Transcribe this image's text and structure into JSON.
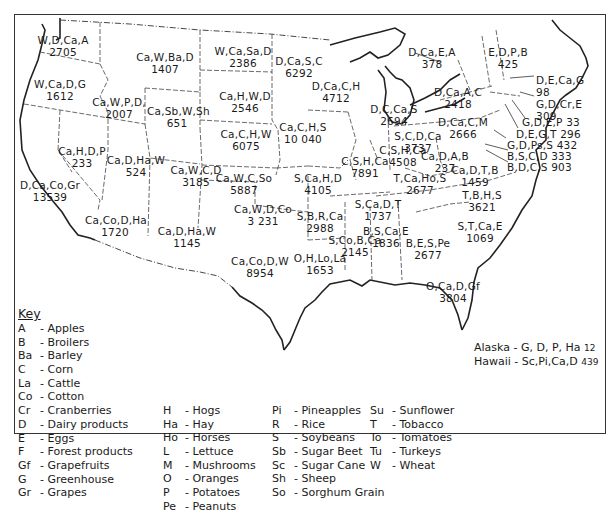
{
  "map": {
    "states": [
      {
        "id": "WA",
        "crops": "W,D,Ca,A",
        "value": "2705",
        "x": 63,
        "y": 34
      },
      {
        "id": "OR",
        "crops": "W,Ca,D,G",
        "value": "1612",
        "x": 60,
        "y": 78
      },
      {
        "id": "ID",
        "crops": "Ca,W,P,D,",
        "value": "2007",
        "x": 119,
        "y": 96
      },
      {
        "id": "MT",
        "crops": "Ca,W,Ba,D",
        "value": "1407",
        "x": 165,
        "y": 51
      },
      {
        "id": "WY",
        "crops": "Ca,Sb,W,Sh",
        "value": "651",
        "x": 177,
        "y": 105
      },
      {
        "id": "ND",
        "crops": "W,Ca,Sa,D",
        "value": "2386",
        "x": 243,
        "y": 45
      },
      {
        "id": "SD",
        "crops": "Ca,H,W,D",
        "value": "2546",
        "x": 245,
        "y": 90
      },
      {
        "id": "NE",
        "crops": "Ca,C,H,W",
        "value": "6075",
        "x": 246,
        "y": 128
      },
      {
        "id": "MN",
        "crops": "D,Ca,S,C",
        "value": "6292",
        "x": 299,
        "y": 55
      },
      {
        "id": "WI",
        "crops": "D,Ca,C,H",
        "value": "4712",
        "x": 336,
        "y": 80
      },
      {
        "id": "IA",
        "crops": "Ca,C,H,S",
        "value": "10 040",
        "x": 303,
        "y": 121
      },
      {
        "id": "MI",
        "crops": "D,C,Ca,S",
        "value": "2694",
        "x": 394,
        "y": 103
      },
      {
        "id": "NV",
        "crops": "Ca,H,D,P",
        "value": "233",
        "x": 82,
        "y": 145
      },
      {
        "id": "CA",
        "crops": "D,Ca,Co,Gr",
        "value": "13539",
        "x": 50,
        "y": 179
      },
      {
        "id": "UT",
        "crops": "Ca,D,Ha,W",
        "value": "524",
        "x": 136,
        "y": 154
      },
      {
        "id": "CO",
        "crops": "Ca,W,C,D",
        "value": "3185",
        "x": 196,
        "y": 164
      },
      {
        "id": "KS",
        "crops": "Ca,W,C,So",
        "value": "5887",
        "x": 244,
        "y": 172
      },
      {
        "id": "MO",
        "crops": "S,Ca,H,D",
        "value": "4105",
        "x": 318,
        "y": 172
      },
      {
        "id": "IL",
        "crops": "C,S,H,Ca",
        "value": "7891",
        "x": 365,
        "y": 155
      },
      {
        "id": "IN",
        "crops": "C,S,H,Ca",
        "value": "4508",
        "x": 403,
        "y": 144
      },
      {
        "id": "OH",
        "crops": "S,C,D,Ca",
        "value": "3737",
        "x": 418,
        "y": 130
      },
      {
        "id": "PA",
        "crops": "D,Ca,C,M",
        "value": "2666",
        "x": 463,
        "y": 116
      },
      {
        "id": "NY",
        "crops": "D,Ca,A,C",
        "value": "2418",
        "x": 458,
        "y": 86
      },
      {
        "id": "AZ",
        "crops": "Ca,Co,D,Ha",
        "value": "1720",
        "x": 115,
        "y": 214
      },
      {
        "id": "NM",
        "crops": "Ca,D,Ha,W",
        "value": "1145",
        "x": 187,
        "y": 225
      },
      {
        "id": "OK",
        "crops": "Ca,W,D,Co",
        "value": "3 231",
        "x": 263,
        "y": 203
      },
      {
        "id": "TX",
        "crops": "Ca,Co,D,W",
        "value": "8954",
        "x": 260,
        "y": 255
      },
      {
        "id": "AR",
        "crops": "S,B,R,Ca",
        "value": "2988",
        "x": 320,
        "y": 210
      },
      {
        "id": "LA",
        "crops": "O,H,Lo,La",
        "value": "1653",
        "x": 320,
        "y": 252
      },
      {
        "id": "MS",
        "crops": "S,Co,B,Ca",
        "value": "2145",
        "x": 355,
        "y": 234
      },
      {
        "id": "AL",
        "crops": "B,S,Ca,E",
        "value": "1836",
        "x": 386,
        "y": 225
      },
      {
        "id": "TN",
        "crops": "S,Ca,D,T",
        "value": "1737",
        "x": 378,
        "y": 198
      },
      {
        "id": "KY",
        "crops": "T,Ca,Ho,S",
        "value": "2677",
        "x": 420,
        "y": 172
      },
      {
        "id": "WV",
        "crops": "Ca,D,A,B",
        "value": "237",
        "x": 445,
        "y": 150
      },
      {
        "id": "VA",
        "crops": "Ca,D,T,B",
        "value": "1459",
        "x": 475,
        "y": 164
      },
      {
        "id": "NC",
        "crops": "T,B,H,S",
        "value": "3621",
        "x": 482,
        "y": 189
      },
      {
        "id": "SC",
        "crops": "S,T,Ca,E",
        "value": "1069",
        "x": 480,
        "y": 220
      },
      {
        "id": "GA",
        "crops": "B,E,S,Pe",
        "value": "2677",
        "x": 428,
        "y": 237
      },
      {
        "id": "FL",
        "crops": "O,Ca,D,Gf",
        "value": "3804",
        "x": 453,
        "y": 280
      },
      {
        "id": "VT",
        "crops": "D,Ca,E,A",
        "value": "378",
        "x": 432,
        "y": 46
      },
      {
        "id": "ME",
        "crops": "E,D,P,B",
        "value": "425",
        "x": 508,
        "y": 46
      }
    ],
    "callouts": [
      {
        "id": "NH",
        "text": "D,E,Ca,G",
        "value": "98"
      },
      {
        "id": "MA",
        "text": "G,D,Cr,E",
        "value": "309"
      },
      {
        "id": "RI",
        "text": "G,D,E,P 33"
      },
      {
        "id": "CT",
        "text": "D,E,G,T 296"
      },
      {
        "id": "NJ",
        "text": "G,D,Ps,S 432"
      },
      {
        "id": "DE",
        "text": "B,S,C,D 333"
      },
      {
        "id": "MD",
        "text": "B,D,C,S 903"
      }
    ]
  },
  "key": {
    "title": "Key",
    "columns": [
      [
        {
          "code": "A",
          "label": "- Apples"
        },
        {
          "code": "B",
          "label": "- Broilers"
        },
        {
          "code": "Ba",
          "label": "- Barley"
        },
        {
          "code": "C",
          "label": "- Corn"
        },
        {
          "code": "La",
          "label": "- Cattle"
        },
        {
          "code": "Co",
          "label": "- Cotton"
        },
        {
          "code": "Cr",
          "label": "- Cranberries"
        },
        {
          "code": "D",
          "label": "- Dairy products"
        },
        {
          "code": "E",
          "label": "- Eggs"
        },
        {
          "code": "F",
          "label": "- Forest products"
        },
        {
          "code": "Gf",
          "label": "- Grapefruits"
        },
        {
          "code": "G",
          "label": "- Greenhouse"
        },
        {
          "code": "Gr",
          "label": "- Grapes"
        }
      ],
      [
        {
          "code": "H",
          "label": "- Hogs"
        },
        {
          "code": "Ha",
          "label": "- Hay"
        },
        {
          "code": "Ho",
          "label": "- Horses"
        },
        {
          "code": "L",
          "label": "- Lettuce"
        },
        {
          "code": "M",
          "label": "- Mushrooms"
        },
        {
          "code": "O",
          "label": "- Oranges"
        },
        {
          "code": "P",
          "label": "- Potatoes"
        },
        {
          "code": "Pe",
          "label": "- Peanuts"
        }
      ],
      [
        {
          "code": "Pi",
          "label": "- Pineapples"
        },
        {
          "code": "R",
          "label": "- Rice"
        },
        {
          "code": "S",
          "label": "- Soybeans"
        },
        {
          "code": "Sb",
          "label": "- Sugar Beet"
        },
        {
          "code": "Sc",
          "label": "- Sugar Cane"
        },
        {
          "code": "Sh",
          "label": "- Sheep"
        },
        {
          "code": "So",
          "label": "- Sorghum Grain"
        }
      ],
      [
        {
          "code": "Su",
          "label": "- Sunflower"
        },
        {
          "code": "T",
          "label": "- Tobacco"
        },
        {
          "code": "To",
          "label": "- Tomatoes"
        },
        {
          "code": "Tu",
          "label": "- Turkeys"
        },
        {
          "code": "W",
          "label": "- Wheat"
        }
      ]
    ]
  },
  "extras": {
    "alaska": {
      "label": "Alaska - G, D, P, Ha",
      "value": "12"
    },
    "hawaii": {
      "label": "Hawaii - Sc,Pi,Ca,D",
      "value": "439"
    }
  }
}
